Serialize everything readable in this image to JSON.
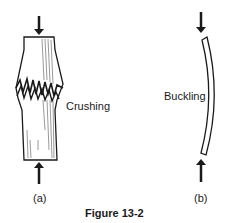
{
  "figure": {
    "caption": "Figure 13-2",
    "panels": [
      {
        "id": "a",
        "label": "(a)",
        "annotation": "Crushing",
        "description": "Short column under axial compressive load failing by crushing (bulged shape with jagged fracture band)"
      },
      {
        "id": "b",
        "label": "(b)",
        "annotation": "Buckling",
        "description": "Slender column under axial compressive load failing by buckling (bowed shape)"
      }
    ],
    "load_arrows": [
      "top-down",
      "bottom-up"
    ]
  },
  "colors": {
    "ink": "#1a1a1a",
    "background": "#ffffff"
  }
}
